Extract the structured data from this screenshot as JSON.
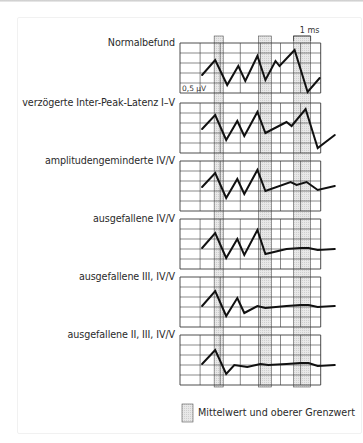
{
  "figure": {
    "type": "brainstem auditory evoked potential (BAEP) pattern diagram",
    "scale_amplitude": "0,5 µV",
    "scale_time": "1 ms",
    "grid": {
      "columns": 7,
      "rows": 5
    },
    "reference_bands": [
      {
        "name": "band-wave-I",
        "from_col": 1.7,
        "to_col": 2.15
      },
      {
        "name": "band-wave-III",
        "from_col": 3.9,
        "to_col": 4.55
      },
      {
        "name": "band-wave-V",
        "from_col": 5.65,
        "to_col": 6.5
      }
    ],
    "panels": [
      {
        "label": "Normalbefund",
        "trace": [
          [
            1.1,
            3.2
          ],
          [
            1.75,
            1.7
          ],
          [
            2.35,
            4.2
          ],
          [
            2.9,
            2.3
          ],
          [
            3.25,
            3.8
          ],
          [
            3.85,
            1.3
          ],
          [
            4.25,
            3.7
          ],
          [
            4.75,
            1.8
          ],
          [
            4.95,
            2.3
          ],
          [
            5.7,
            0.7
          ],
          [
            6.35,
            4.9
          ],
          [
            6.95,
            3.5
          ]
        ]
      },
      {
        "label": "verzögerte Inter-Peak-Latenz I–V",
        "trace": [
          [
            1.1,
            2.6
          ],
          [
            1.75,
            1.2
          ],
          [
            2.3,
            3.7
          ],
          [
            2.85,
            1.8
          ],
          [
            3.2,
            3.3
          ],
          [
            3.85,
            0.9
          ],
          [
            4.25,
            3.0
          ],
          [
            5.3,
            1.9
          ],
          [
            5.55,
            2.3
          ],
          [
            6.25,
            0.6
          ],
          [
            6.85,
            4.5
          ],
          [
            7.7,
            3.2
          ]
        ]
      },
      {
        "label": "amplitudengeminderte IV/V",
        "trace": [
          [
            1.1,
            2.6
          ],
          [
            1.75,
            1.2
          ],
          [
            2.3,
            3.7
          ],
          [
            2.85,
            1.8
          ],
          [
            3.2,
            3.3
          ],
          [
            3.85,
            0.9
          ],
          [
            4.25,
            3.0
          ],
          [
            5.5,
            2.1
          ],
          [
            5.8,
            2.4
          ],
          [
            6.3,
            2.1
          ],
          [
            6.85,
            2.9
          ],
          [
            7.7,
            2.5
          ]
        ]
      },
      {
        "label": "ausgefallene IV/V",
        "trace": [
          [
            1.1,
            2.9
          ],
          [
            1.75,
            1.4
          ],
          [
            2.3,
            3.9
          ],
          [
            2.85,
            2.0
          ],
          [
            3.2,
            3.6
          ],
          [
            3.85,
            1.1
          ],
          [
            4.25,
            3.5
          ],
          [
            5.3,
            3.0
          ],
          [
            6.0,
            2.9
          ],
          [
            6.4,
            2.9
          ],
          [
            6.85,
            3.1
          ],
          [
            7.7,
            3.0
          ]
        ]
      },
      {
        "label": "ausgefallene III, IV/V",
        "trace": [
          [
            1.1,
            2.9
          ],
          [
            1.75,
            1.4
          ],
          [
            2.3,
            3.9
          ],
          [
            2.85,
            2.1
          ],
          [
            3.2,
            3.6
          ],
          [
            3.85,
            2.9
          ],
          [
            4.25,
            3.1
          ],
          [
            5.3,
            2.9
          ],
          [
            6.0,
            2.8
          ],
          [
            6.4,
            2.8
          ],
          [
            6.85,
            3.0
          ],
          [
            7.7,
            2.9
          ]
        ]
      },
      {
        "label": "ausgefallene II, III, IV/V",
        "trace": [
          [
            1.1,
            2.9
          ],
          [
            1.75,
            1.5
          ],
          [
            2.3,
            3.9
          ],
          [
            2.7,
            3.0
          ],
          [
            3.35,
            3.2
          ],
          [
            4.0,
            2.9
          ],
          [
            4.4,
            3.0
          ],
          [
            5.3,
            2.9
          ],
          [
            6.0,
            2.8
          ],
          [
            6.4,
            2.8
          ],
          [
            6.85,
            3.1
          ],
          [
            7.7,
            3.0
          ]
        ]
      }
    ]
  },
  "legend": {
    "label": "Mittelwert und oberer Grenzwert"
  },
  "colors": {
    "grid": "#3a3a3a",
    "trace": "#111111",
    "band_fill": "#e8e8e8",
    "band_stroke": "#555555"
  }
}
